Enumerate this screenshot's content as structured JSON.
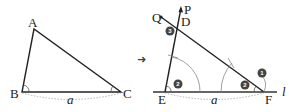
{
  "left_triangle": {
    "vertices": {
      "A": "A",
      "B": "B",
      "C": "C"
    },
    "side_label": "a"
  },
  "transform_arrow": "➜",
  "right_construction": {
    "vertices": {
      "D": "D",
      "E": "E",
      "F": "F"
    },
    "ray_labels": {
      "P": "P",
      "Q": "Q"
    },
    "line_label": "l",
    "side_label": "a",
    "steps": [
      "1",
      "2",
      "2",
      "3"
    ]
  },
  "colors": {
    "line": "#222222",
    "base_line": "#666666",
    "arc": "#888888",
    "badge": "#444444",
    "dotted": "#aaaaaa"
  }
}
